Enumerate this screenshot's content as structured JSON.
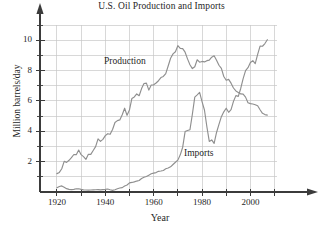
{
  "chart_data": {
    "type": "line",
    "title": "U.S. Oil Production and Imports",
    "xlabel": "Year",
    "ylabel": "Million barrels/day",
    "xlim": [
      1913,
      2011
    ],
    "ylim": [
      0,
      11
    ],
    "xticks": [
      1920,
      1940,
      1960,
      1980,
      2000
    ],
    "yticks": [
      2,
      4,
      6,
      8,
      10
    ],
    "x_minor_step": 10,
    "y_minor_step": 1,
    "grid": true,
    "legend_position": "inline-annotations",
    "line_color": "#8f8f8f",
    "axis_color": "#3b3b3b",
    "grid_color": "#c8c8c8",
    "series": [
      {
        "name": "Production",
        "label_x": 1957,
        "label_y": 8.45,
        "x": [
          1920,
          1921,
          1922,
          1923,
          1924,
          1925,
          1926,
          1927,
          1928,
          1929,
          1930,
          1931,
          1932,
          1933,
          1934,
          1935,
          1936,
          1937,
          1938,
          1939,
          1940,
          1941,
          1942,
          1943,
          1944,
          1945,
          1946,
          1947,
          1948,
          1949,
          1950,
          1951,
          1952,
          1953,
          1954,
          1955,
          1956,
          1957,
          1958,
          1959,
          1960,
          1961,
          1962,
          1963,
          1964,
          1965,
          1966,
          1967,
          1968,
          1969,
          1970,
          1971,
          1972,
          1973,
          1974,
          1975,
          1976,
          1977,
          1978,
          1979,
          1980,
          1981,
          1982,
          1983,
          1984,
          1985,
          1986,
          1987,
          1988,
          1989,
          1990,
          1991,
          1992,
          1993,
          1994,
          1995,
          1996,
          1997,
          1998,
          1999,
          2000,
          2001,
          2002,
          2003,
          2004,
          2005,
          2006,
          2007
        ],
        "y": [
          1.21,
          1.29,
          1.53,
          2.02,
          1.95,
          2.09,
          2.26,
          2.47,
          2.46,
          2.76,
          2.46,
          2.33,
          2.15,
          2.48,
          2.48,
          2.73,
          2.99,
          3.5,
          3.33,
          3.47,
          3.71,
          3.84,
          3.8,
          4.12,
          4.58,
          4.7,
          4.75,
          5.09,
          5.52,
          5.05,
          5.41,
          6.16,
          6.26,
          6.46,
          6.34,
          6.81,
          7.15,
          7.17,
          6.71,
          7.05,
          7.06,
          7.18,
          7.33,
          7.54,
          7.61,
          7.8,
          8.3,
          8.81,
          9.1,
          9.24,
          9.64,
          9.46,
          9.44,
          9.21,
          8.77,
          8.38,
          8.13,
          8.25,
          8.71,
          8.55,
          8.6,
          8.57,
          8.65,
          8.69,
          8.88,
          8.97,
          8.68,
          8.35,
          8.14,
          7.61,
          7.36,
          7.42,
          7.17,
          6.85,
          6.66,
          6.56,
          6.46,
          6.45,
          6.25,
          5.88,
          5.82,
          5.8,
          5.75,
          5.68,
          5.42,
          5.18,
          5.1,
          5.06
        ]
      },
      {
        "name": "Imports",
        "label_x": 1984,
        "label_y": 2.55,
        "x": [
          1920,
          1921,
          1922,
          1923,
          1924,
          1925,
          1926,
          1927,
          1928,
          1929,
          1930,
          1931,
          1932,
          1933,
          1934,
          1935,
          1936,
          1937,
          1938,
          1939,
          1940,
          1941,
          1942,
          1943,
          1944,
          1945,
          1946,
          1947,
          1948,
          1949,
          1950,
          1951,
          1952,
          1953,
          1954,
          1955,
          1956,
          1957,
          1958,
          1959,
          1960,
          1961,
          1962,
          1963,
          1964,
          1965,
          1966,
          1967,
          1968,
          1969,
          1970,
          1971,
          1972,
          1973,
          1974,
          1975,
          1976,
          1977,
          1978,
          1979,
          1980,
          1981,
          1982,
          1983,
          1984,
          1985,
          1986,
          1987,
          1988,
          1989,
          1990,
          1991,
          1992,
          1993,
          1994,
          1995,
          1996,
          1997,
          1998,
          1999,
          2000,
          2001,
          2002,
          2003,
          2004,
          2005,
          2006,
          2007
        ],
        "y": [
          0.28,
          0.36,
          0.4,
          0.31,
          0.22,
          0.17,
          0.16,
          0.17,
          0.21,
          0.21,
          0.17,
          0.14,
          0.13,
          0.12,
          0.13,
          0.14,
          0.15,
          0.16,
          0.14,
          0.16,
          0.17,
          0.2,
          0.15,
          0.11,
          0.15,
          0.21,
          0.26,
          0.29,
          0.4,
          0.46,
          0.6,
          0.63,
          0.67,
          0.72,
          0.76,
          0.89,
          0.97,
          1.02,
          1.11,
          1.2,
          1.24,
          1.28,
          1.36,
          1.38,
          1.42,
          1.53,
          1.58,
          1.66,
          1.81,
          1.96,
          2.1,
          2.45,
          2.95,
          3.98,
          4.05,
          4.1,
          5.12,
          6.25,
          6.4,
          6.56,
          5.95,
          5.4,
          4.3,
          3.33,
          3.43,
          3.2,
          3.92,
          4.46,
          4.96,
          5.28,
          5.52,
          5.25,
          5.42,
          5.97,
          6.35,
          6.3,
          6.82,
          7.47,
          7.99,
          8.19,
          8.53,
          8.65,
          8.45,
          9.07,
          9.61,
          9.6,
          9.78,
          10.03
        ]
      }
    ]
  },
  "annotations": {
    "production_label": "Production",
    "imports_label": "Imports"
  },
  "axes": {
    "title": "U.S. Oil Production and Imports",
    "x_title": "Year",
    "y_title": "Million barrels/day",
    "x_tick_labels": [
      "1920",
      "1940",
      "1960",
      "1980",
      "2000"
    ],
    "y_tick_labels": [
      "2",
      "4",
      "6",
      "8",
      "10"
    ]
  }
}
